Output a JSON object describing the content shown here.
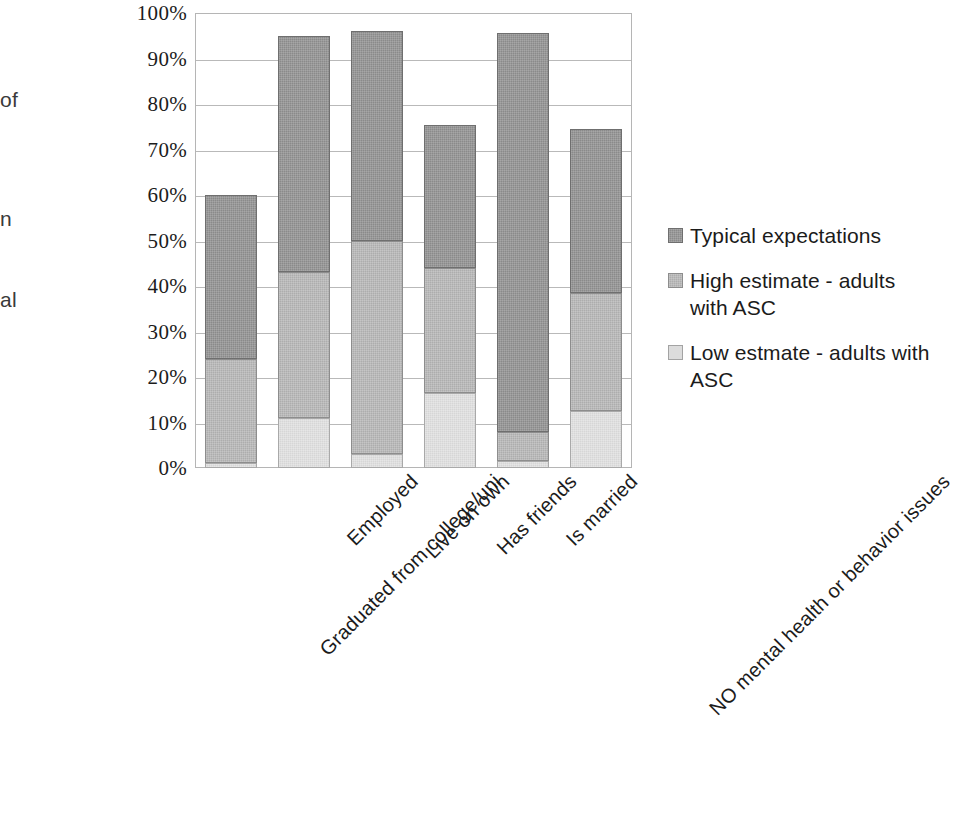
{
  "edge_fragments": {
    "line1": "of",
    "line2": "n",
    "line3": "al"
  },
  "chart_data": {
    "type": "bar",
    "subtype": "stacked-bar",
    "title": "",
    "xlabel": "",
    "ylabel": "",
    "ylim": [
      0,
      100
    ],
    "yunit": "%",
    "grid": true,
    "legend_position": "right",
    "categories": [
      "Graduated from college/uni",
      "Employed",
      "Live on own",
      "Has friends",
      "Is married",
      "NO mental health or behavior issues"
    ],
    "ytick_labels": [
      "100%",
      "90%",
      "80%",
      "70%",
      "60%",
      "50%",
      "40%",
      "30%",
      "20%",
      "10%",
      "0%"
    ],
    "ytick_values": [
      100,
      90,
      80,
      70,
      60,
      50,
      40,
      30,
      20,
      10,
      0
    ],
    "series": [
      {
        "name": "Low estmate - adults with ASC",
        "color": "#d6d6d6",
        "values": [
          1,
          11,
          3,
          16.5,
          1.5,
          12.5
        ]
      },
      {
        "name": "High estimate - adults with ASC",
        "color": "#adadad",
        "values": [
          23,
          32,
          47,
          27.5,
          6.5,
          26
        ]
      },
      {
        "name": "Typical expectations",
        "color": "#8a8a8a",
        "values": [
          36,
          52,
          46,
          31.5,
          87.5,
          36
        ]
      }
    ],
    "cumulative_tops": {
      "low": [
        1,
        11,
        3,
        16.5,
        1.5,
        12.5
      ],
      "high": [
        24,
        43,
        50,
        44,
        8,
        38.5
      ],
      "typical": [
        60,
        95,
        96,
        75.5,
        95.5,
        74.5
      ]
    }
  },
  "legend": {
    "items": [
      {
        "label": "Typical expectations",
        "swatch": "typical"
      },
      {
        "label": "High estimate - adults with ASC",
        "swatch": "high"
      },
      {
        "label": "Low estmate - adults with ASC",
        "swatch": "low"
      }
    ]
  }
}
